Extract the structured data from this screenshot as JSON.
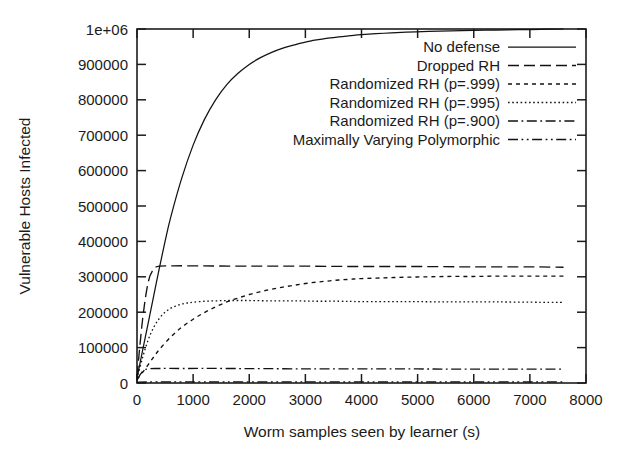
{
  "chart_data": {
    "type": "line",
    "title": "",
    "xlabel": "Worm samples seen by learner (s)",
    "ylabel": "Vulnerable Hosts Infected",
    "xlim": [
      0,
      8000
    ],
    "ylim": [
      0,
      1000000
    ],
    "grid": false,
    "legend_position": "top-right",
    "x_ticklabels": [
      "0",
      "1000",
      "2000",
      "3000",
      "4000",
      "5000",
      "6000",
      "7000",
      "8000"
    ],
    "x_tickvalues": [
      0,
      1000,
      2000,
      3000,
      4000,
      5000,
      6000,
      7000,
      8000
    ],
    "y_ticklabels": [
      "0",
      "100000",
      "200000",
      "300000",
      "400000",
      "500000",
      "600000",
      "700000",
      "800000",
      "900000",
      "1e+06"
    ],
    "y_tickvalues": [
      0,
      100000,
      200000,
      300000,
      400000,
      500000,
      600000,
      700000,
      800000,
      900000,
      1000000
    ],
    "x_data_extent": [
      0,
      7600
    ],
    "series": [
      {
        "name": "No defense",
        "dash": "solid",
        "plateau": 1000000,
        "x": [
          0,
          100,
          200,
          300,
          400,
          500,
          600,
          800,
          1000,
          1200,
          1400,
          1600,
          1800,
          2000,
          2200,
          2400,
          2600,
          2800,
          3000,
          3200,
          3400,
          3600,
          3800,
          4000,
          4400,
          4800,
          5200,
          5600,
          6000,
          6400,
          6800,
          7200,
          7600
        ],
        "values": [
          14000,
          92000,
          170000,
          248000,
          326000,
          400000,
          468000,
          580000,
          672000,
          744000,
          800000,
          843000,
          875000,
          900000,
          919000,
          934000,
          946000,
          955000,
          963000,
          969000,
          974000,
          978000,
          981000,
          984000,
          988000,
          991000,
          993000,
          995000,
          996000,
          997000,
          998000,
          999000,
          1000000
        ]
      },
      {
        "name": "Dropped RH",
        "dash": "dashed",
        "plateau": 330000,
        "x": [
          0,
          100,
          200,
          300,
          400,
          600,
          1000,
          2000,
          3000,
          4000,
          5000,
          6000,
          7000,
          7600
        ],
        "values": [
          18000,
          180000,
          285000,
          322000,
          330000,
          331000,
          331000,
          330000,
          330000,
          329000,
          329000,
          328000,
          328000,
          327000
        ]
      },
      {
        "name": "Randomized RH (p=.999)",
        "dash": "short-dash",
        "plateau": 300000,
        "x": [
          0,
          100,
          200,
          300,
          400,
          600,
          800,
          1000,
          1200,
          1400,
          1600,
          1800,
          2000,
          2200,
          2400,
          2600,
          2800,
          3000,
          3200,
          3400,
          3600,
          3800,
          4000,
          4400,
          4800,
          5200,
          5600,
          6000,
          6400,
          6800,
          7200,
          7600
        ],
        "values": [
          10000,
          30000,
          52000,
          74000,
          95000,
          130000,
          158000,
          180000,
          199000,
          215000,
          229000,
          240000,
          250000,
          258000,
          265000,
          271000,
          276000,
          281000,
          285000,
          288000,
          291000,
          293000,
          295000,
          297000,
          299000,
          300000,
          301000,
          301000,
          302000,
          302000,
          302000,
          302000
        ]
      },
      {
        "name": "Randomized RH (p=.995)",
        "dash": "dotted",
        "plateau": 230000,
        "x": [
          0,
          100,
          200,
          300,
          400,
          500,
          600,
          700,
          800,
          900,
          1000,
          1200,
          1400,
          1600,
          1800,
          2000,
          2400,
          2800,
          3200,
          3600,
          4000,
          4800,
          5600,
          6400,
          7200,
          7600
        ],
        "values": [
          12000,
          72000,
          122000,
          158000,
          183000,
          200000,
          211000,
          218000,
          223000,
          226000,
          228000,
          231000,
          232000,
          233000,
          233000,
          233000,
          232000,
          232000,
          231000,
          231000,
          230000,
          230000,
          229000,
          229000,
          228000,
          228000
        ]
      },
      {
        "name": "Randomized RH (p=.900)",
        "dash": "dash-dot",
        "plateau": 40000,
        "x": [
          0,
          100,
          200,
          400,
          800,
          1600,
          3000,
          4500,
          6000,
          7600
        ],
        "values": [
          9000,
          33000,
          40000,
          41000,
          41000,
          41000,
          40000,
          40000,
          39000,
          39000
        ]
      },
      {
        "name": "Maximally Varying Polymorphic",
        "dash": "dash-dot-dot",
        "plateau": 3000,
        "x": [
          0,
          200,
          600,
          1200,
          2000,
          3000,
          4000,
          5000,
          6000,
          7000,
          7600
        ],
        "values": [
          2000,
          3000,
          3000,
          3000,
          3000,
          3000,
          3000,
          3000,
          3000,
          3000,
          3000
        ]
      }
    ]
  },
  "axes": {
    "x_title": "Worm samples seen by learner (s)",
    "y_title": "Vulnerable Hosts Infected"
  },
  "legend": {
    "entries": [
      {
        "label": "No defense",
        "dash": "solid"
      },
      {
        "label": "Dropped RH",
        "dash": "dashed"
      },
      {
        "label": "Randomized RH (p=.999)",
        "dash": "short-dash"
      },
      {
        "label": "Randomized RH (p=.995)",
        "dash": "dotted"
      },
      {
        "label": "Randomized RH (p=.900)",
        "dash": "dash-dot"
      },
      {
        "label": "Maximally Varying Polymorphic",
        "dash": "dash-dot-dot"
      }
    ]
  },
  "colors": {
    "ink": "#121212",
    "background": "#ffffff"
  }
}
